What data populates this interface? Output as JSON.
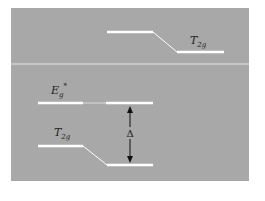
{
  "diagram": {
    "type": "energy-level-diagram",
    "colors": {
      "background": "#ffffff",
      "panel": "#a8a8a8",
      "level_line": "#ffffff",
      "arrow": "#111111",
      "text": "#222222"
    },
    "upper_panel": {
      "levels": [
        {
          "label_main": "T",
          "label_sub": "2g"
        }
      ]
    },
    "lower_panel": {
      "levels": [
        {
          "label_main": "E",
          "label_sub": "g",
          "label_sup": "*"
        },
        {
          "label_main": "T",
          "label_sub": "2g"
        }
      ],
      "splitting_label": "Δ"
    }
  }
}
